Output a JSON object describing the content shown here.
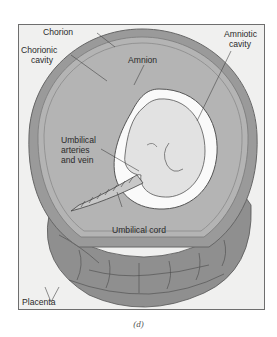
{
  "figure": {
    "caption": "(d)"
  },
  "labels": {
    "chorion": "Chorion",
    "chorionic_cavity_1": "Chorionic",
    "chorionic_cavity_2": "cavity",
    "amnion": "Amnion",
    "amniotic_cavity_1": "Amniotic",
    "amniotic_cavity_2": "cavity",
    "umbilical_vessels_1": "Umbilical",
    "umbilical_vessels_2": "arteries",
    "umbilical_vessels_3": "and vein",
    "umbilical_cord": "Umbilical cord",
    "placenta": "Placenta"
  },
  "colors": {
    "background": "#ffffff",
    "frame_fill": "#f0f0ef",
    "chorion": "#9a9a9a",
    "chorionic_cavity": "#b4b4b4",
    "amniotic_cavity": "#fafafa",
    "embryo": "#e2e2e2",
    "placenta": "#8f8f8f",
    "text": "#2a2a2a"
  }
}
